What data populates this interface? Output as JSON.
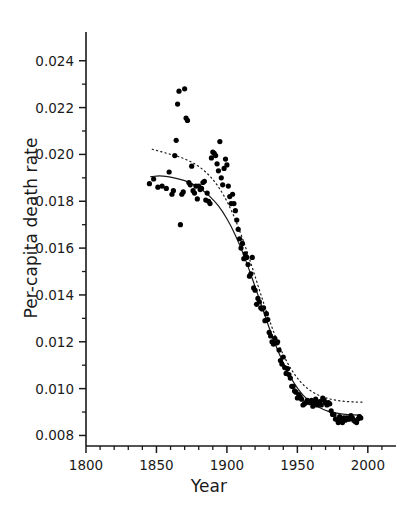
{
  "chart_data": {
    "type": "scatter",
    "title": "",
    "xlabel": "Year",
    "ylabel": "Per-capita death rate",
    "xlim": [
      1800,
      2020
    ],
    "ylim": [
      0.00755,
      0.0248
    ],
    "xticks": [
      1800,
      1850,
      1900,
      1950,
      2000
    ],
    "xtick_labels": [
      "1800",
      "1850",
      "1900",
      "1950",
      "2000"
    ],
    "yticks": [
      0.008,
      0.01,
      0.012,
      0.014,
      0.016,
      0.018,
      0.02,
      0.022,
      0.024
    ],
    "ytick_labels": [
      "0.008",
      "0.010",
      "0.012",
      "0.014",
      "0.016",
      "0.018",
      "0.020",
      "0.022",
      "0.024"
    ],
    "minor_yticks": [
      0.009,
      0.011,
      0.013,
      0.015,
      0.017,
      0.019,
      0.021,
      0.023
    ],
    "minor_xticks": [
      1810,
      1820,
      1830,
      1840,
      1860,
      1870,
      1880,
      1890,
      1910,
      1920,
      1930,
      1940,
      1960,
      1970,
      1980,
      1990,
      2010
    ],
    "grid": false,
    "legend": "none",
    "marker": "filled-circle",
    "marker_color": "#000000",
    "marker_size_px": 5.2,
    "axis_color": "#1a1a1a",
    "points": [
      {
        "x": 1845,
        "y": 0.01875
      },
      {
        "x": 1848,
        "y": 0.01895
      },
      {
        "x": 1851,
        "y": 0.0186
      },
      {
        "x": 1854,
        "y": 0.01865
      },
      {
        "x": 1857,
        "y": 0.01855
      },
      {
        "x": 1859,
        "y": 0.01925
      },
      {
        "x": 1861,
        "y": 0.0183
      },
      {
        "x": 1862,
        "y": 0.01845
      },
      {
        "x": 1863,
        "y": 0.01995
      },
      {
        "x": 1864,
        "y": 0.0206
      },
      {
        "x": 1865,
        "y": 0.02215
      },
      {
        "x": 1866,
        "y": 0.0227
      },
      {
        "x": 1867,
        "y": 0.017
      },
      {
        "x": 1868,
        "y": 0.0183
      },
      {
        "x": 1869,
        "y": 0.0184
      },
      {
        "x": 1870,
        "y": 0.0228
      },
      {
        "x": 1871,
        "y": 0.02155
      },
      {
        "x": 1872,
        "y": 0.02145
      },
      {
        "x": 1873,
        "y": 0.0188
      },
      {
        "x": 1874,
        "y": 0.0187
      },
      {
        "x": 1875,
        "y": 0.0195
      },
      {
        "x": 1876,
        "y": 0.01845
      },
      {
        "x": 1877,
        "y": 0.01835
      },
      {
        "x": 1878,
        "y": 0.01865
      },
      {
        "x": 1879,
        "y": 0.0181
      },
      {
        "x": 1880,
        "y": 0.01865
      },
      {
        "x": 1881,
        "y": 0.0185
      },
      {
        "x": 1882,
        "y": 0.01855
      },
      {
        "x": 1883,
        "y": 0.0188
      },
      {
        "x": 1884,
        "y": 0.01885
      },
      {
        "x": 1885,
        "y": 0.01805
      },
      {
        "x": 1886,
        "y": 0.01835
      },
      {
        "x": 1887,
        "y": 0.018
      },
      {
        "x": 1888,
        "y": 0.0179
      },
      {
        "x": 1889,
        "y": 0.01985
      },
      {
        "x": 1890,
        "y": 0.0201
      },
      {
        "x": 1891,
        "y": 0.02005
      },
      {
        "x": 1892,
        "y": 0.01995
      },
      {
        "x": 1893,
        "y": 0.0196
      },
      {
        "x": 1894,
        "y": 0.0193
      },
      {
        "x": 1895,
        "y": 0.02055
      },
      {
        "x": 1896,
        "y": 0.019
      },
      {
        "x": 1897,
        "y": 0.0187
      },
      {
        "x": 1898,
        "y": 0.0194
      },
      {
        "x": 1899,
        "y": 0.0198
      },
      {
        "x": 1900,
        "y": 0.01955
      },
      {
        "x": 1901,
        "y": 0.01865
      },
      {
        "x": 1902,
        "y": 0.0182
      },
      {
        "x": 1903,
        "y": 0.0179
      },
      {
        "x": 1904,
        "y": 0.0183
      },
      {
        "x": 1905,
        "y": 0.0179
      },
      {
        "x": 1906,
        "y": 0.0176
      },
      {
        "x": 1907,
        "y": 0.0172
      },
      {
        "x": 1908,
        "y": 0.0168
      },
      {
        "x": 1909,
        "y": 0.0164
      },
      {
        "x": 1910,
        "y": 0.016
      },
      {
        "x": 1911,
        "y": 0.0162
      },
      {
        "x": 1912,
        "y": 0.01555
      },
      {
        "x": 1913,
        "y": 0.01575
      },
      {
        "x": 1914,
        "y": 0.0156
      },
      {
        "x": 1915,
        "y": 0.0153
      },
      {
        "x": 1916,
        "y": 0.0148
      },
      {
        "x": 1917,
        "y": 0.0149
      },
      {
        "x": 1918,
        "y": 0.0156
      },
      {
        "x": 1919,
        "y": 0.0143
      },
      {
        "x": 1920,
        "y": 0.0142
      },
      {
        "x": 1921,
        "y": 0.0136
      },
      {
        "x": 1922,
        "y": 0.01385
      },
      {
        "x": 1923,
        "y": 0.0137
      },
      {
        "x": 1924,
        "y": 0.01345
      },
      {
        "x": 1925,
        "y": 0.0134
      },
      {
        "x": 1926,
        "y": 0.01345
      },
      {
        "x": 1927,
        "y": 0.0129
      },
      {
        "x": 1928,
        "y": 0.0132
      },
      {
        "x": 1929,
        "y": 0.01295
      },
      {
        "x": 1930,
        "y": 0.0124
      },
      {
        "x": 1931,
        "y": 0.01225
      },
      {
        "x": 1932,
        "y": 0.012
      },
      {
        "x": 1933,
        "y": 0.0119
      },
      {
        "x": 1934,
        "y": 0.01215
      },
      {
        "x": 1935,
        "y": 0.01195
      },
      {
        "x": 1936,
        "y": 0.012
      },
      {
        "x": 1937,
        "y": 0.01165
      },
      {
        "x": 1938,
        "y": 0.0112
      },
      {
        "x": 1939,
        "y": 0.01105
      },
      {
        "x": 1940,
        "y": 0.01135
      },
      {
        "x": 1941,
        "y": 0.0109
      },
      {
        "x": 1942,
        "y": 0.01065
      },
      {
        "x": 1943,
        "y": 0.01085
      },
      {
        "x": 1944,
        "y": 0.0106
      },
      {
        "x": 1945,
        "y": 0.01045
      },
      {
        "x": 1946,
        "y": 0.0101
      },
      {
        "x": 1947,
        "y": 0.0101
      },
      {
        "x": 1948,
        "y": 0.0099
      },
      {
        "x": 1949,
        "y": 0.00985
      },
      {
        "x": 1950,
        "y": 0.0096
      },
      {
        "x": 1951,
        "y": 0.00975
      },
      {
        "x": 1952,
        "y": 0.00965
      },
      {
        "x": 1953,
        "y": 0.00955
      },
      {
        "x": 1954,
        "y": 0.0093
      },
      {
        "x": 1955,
        "y": 0.00935
      },
      {
        "x": 1956,
        "y": 0.0094
      },
      {
        "x": 1957,
        "y": 0.0095
      },
      {
        "x": 1958,
        "y": 0.00945
      },
      {
        "x": 1959,
        "y": 0.0094
      },
      {
        "x": 1960,
        "y": 0.0095
      },
      {
        "x": 1961,
        "y": 0.00925
      },
      {
        "x": 1962,
        "y": 0.00945
      },
      {
        "x": 1963,
        "y": 0.00955
      },
      {
        "x": 1964,
        "y": 0.0093
      },
      {
        "x": 1965,
        "y": 0.0094
      },
      {
        "x": 1966,
        "y": 0.00945
      },
      {
        "x": 1967,
        "y": 0.0093
      },
      {
        "x": 1968,
        "y": 0.0096
      },
      {
        "x": 1969,
        "y": 0.0095
      },
      {
        "x": 1970,
        "y": 0.0094
      },
      {
        "x": 1971,
        "y": 0.0093
      },
      {
        "x": 1972,
        "y": 0.0094
      },
      {
        "x": 1973,
        "y": 0.00935
      },
      {
        "x": 1974,
        "y": 0.00905
      },
      {
        "x": 1975,
        "y": 0.0089
      },
      {
        "x": 1976,
        "y": 0.0089
      },
      {
        "x": 1977,
        "y": 0.0087
      },
      {
        "x": 1978,
        "y": 0.0087
      },
      {
        "x": 1979,
        "y": 0.00855
      },
      {
        "x": 1980,
        "y": 0.0088
      },
      {
        "x": 1981,
        "y": 0.00865
      },
      {
        "x": 1982,
        "y": 0.00855
      },
      {
        "x": 1983,
        "y": 0.00875
      },
      {
        "x": 1984,
        "y": 0.00865
      },
      {
        "x": 1985,
        "y": 0.00875
      },
      {
        "x": 1986,
        "y": 0.0087
      },
      {
        "x": 1987,
        "y": 0.0087
      },
      {
        "x": 1988,
        "y": 0.00885
      },
      {
        "x": 1989,
        "y": 0.00875
      },
      {
        "x": 1990,
        "y": 0.00865
      },
      {
        "x": 1991,
        "y": 0.0086
      },
      {
        "x": 1992,
        "y": 0.00855
      },
      {
        "x": 1993,
        "y": 0.0087
      },
      {
        "x": 1994,
        "y": 0.0088
      },
      {
        "x": 1995,
        "y": 0.00875
      }
    ],
    "series": [
      {
        "name": "fitted-curve-solid",
        "style": "solid",
        "color": "#1a1a1a",
        "width_px": 1.2,
        "points": [
          {
            "x": 1846,
            "y": 0.01905
          },
          {
            "x": 1852,
            "y": 0.01908
          },
          {
            "x": 1858,
            "y": 0.01905
          },
          {
            "x": 1864,
            "y": 0.01898
          },
          {
            "x": 1870,
            "y": 0.01888
          },
          {
            "x": 1876,
            "y": 0.01872
          },
          {
            "x": 1882,
            "y": 0.0185
          },
          {
            "x": 1888,
            "y": 0.0182
          },
          {
            "x": 1894,
            "y": 0.0178
          },
          {
            "x": 1900,
            "y": 0.01725
          },
          {
            "x": 1906,
            "y": 0.01655
          },
          {
            "x": 1912,
            "y": 0.0157
          },
          {
            "x": 1918,
            "y": 0.0147
          },
          {
            "x": 1924,
            "y": 0.01365
          },
          {
            "x": 1930,
            "y": 0.0126
          },
          {
            "x": 1936,
            "y": 0.01165
          },
          {
            "x": 1942,
            "y": 0.01085
          },
          {
            "x": 1948,
            "y": 0.0102
          },
          {
            "x": 1954,
            "y": 0.00972
          },
          {
            "x": 1960,
            "y": 0.0094
          },
          {
            "x": 1966,
            "y": 0.00918
          },
          {
            "x": 1972,
            "y": 0.00903
          },
          {
            "x": 1978,
            "y": 0.00895
          },
          {
            "x": 1984,
            "y": 0.0089
          },
          {
            "x": 1990,
            "y": 0.00888
          },
          {
            "x": 1995,
            "y": 0.00887
          }
        ]
      },
      {
        "name": "fitted-curve-dotted",
        "style": "dotted",
        "color": "#1a1a1a",
        "width_px": 1.2,
        "points": [
          {
            "x": 1847,
            "y": 0.02022
          },
          {
            "x": 1853,
            "y": 0.02012
          },
          {
            "x": 1859,
            "y": 0.02002
          },
          {
            "x": 1865,
            "y": 0.01992
          },
          {
            "x": 1871,
            "y": 0.01978
          },
          {
            "x": 1877,
            "y": 0.0196
          },
          {
            "x": 1883,
            "y": 0.01935
          },
          {
            "x": 1889,
            "y": 0.019
          },
          {
            "x": 1895,
            "y": 0.01852
          },
          {
            "x": 1901,
            "y": 0.01788
          },
          {
            "x": 1907,
            "y": 0.01706
          },
          {
            "x": 1913,
            "y": 0.01608
          },
          {
            "x": 1919,
            "y": 0.01498
          },
          {
            "x": 1925,
            "y": 0.01385
          },
          {
            "x": 1931,
            "y": 0.01278
          },
          {
            "x": 1937,
            "y": 0.01185
          },
          {
            "x": 1943,
            "y": 0.0111
          },
          {
            "x": 1949,
            "y": 0.01053
          },
          {
            "x": 1955,
            "y": 0.01012
          },
          {
            "x": 1961,
            "y": 0.00985
          },
          {
            "x": 1967,
            "y": 0.00967
          },
          {
            "x": 1973,
            "y": 0.00956
          },
          {
            "x": 1979,
            "y": 0.00949
          },
          {
            "x": 1985,
            "y": 0.00945
          },
          {
            "x": 1991,
            "y": 0.00943
          },
          {
            "x": 1996,
            "y": 0.00942
          }
        ]
      }
    ]
  }
}
